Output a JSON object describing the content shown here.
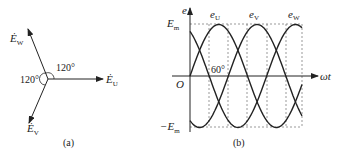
{
  "panel_a": {
    "caption": "(a)",
    "vectors": [
      {
        "name": "E_U",
        "label": "Ė",
        "sub": "U",
        "angle_deg": 0
      },
      {
        "name": "E_V",
        "label": "Ė",
        "sub": "V",
        "angle_deg": -120
      },
      {
        "name": "E_W",
        "label": "Ė",
        "sub": "W",
        "angle_deg": 120
      }
    ],
    "angle_labels": [
      "120°",
      "120°"
    ]
  },
  "panel_b": {
    "caption": "(b)",
    "y_axis_label": "e",
    "x_axis_label": "ωt",
    "origin_label": "O",
    "ymax_label": "E",
    "ymax_sub": "m",
    "ymin_label": "−E",
    "ymin_sub": "m",
    "angle_annotation": "60°",
    "curve_labels": [
      {
        "label": "e",
        "sub": "U"
      },
      {
        "label": "e",
        "sub": "V"
      },
      {
        "label": "e",
        "sub": "W"
      }
    ]
  },
  "colors": {
    "line": "#222222",
    "dash": "#555555"
  }
}
